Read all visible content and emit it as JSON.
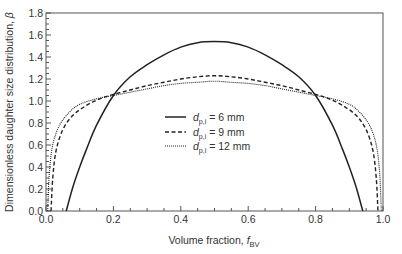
{
  "chart_data": {
    "type": "line",
    "title": "",
    "xlabel": "Volume fraction, f_BV",
    "xlabel_parts": {
      "main": "Volume fraction, ",
      "var": "f",
      "sub": "BV"
    },
    "ylabel": "Dimensionless daughter size distribution, β",
    "ylabel_parts": {
      "main": "Dimensionless daughter size distribution, ",
      "var": "β"
    },
    "xlim": [
      0.0,
      1.0
    ],
    "ylim": [
      0.0,
      1.8
    ],
    "xticks": [
      "0.0",
      "0.2",
      "0.4",
      "0.6",
      "0.8",
      "1.0"
    ],
    "yticks": [
      "0.0",
      "0.2",
      "0.4",
      "0.6",
      "0.8",
      "1.0",
      "1.2",
      "1.4",
      "1.6",
      "1.8"
    ],
    "grid": false,
    "legend_position": "center",
    "series": [
      {
        "name": "d_p,i = 6 mm",
        "legend": {
          "var": "d",
          "sub": "p,i",
          "text": " = 6 mm"
        },
        "style": "solid",
        "x": [
          0.06,
          0.08,
          0.1,
          0.12,
          0.15,
          0.2,
          0.25,
          0.3,
          0.35,
          0.4,
          0.45,
          0.5,
          0.55,
          0.6,
          0.65,
          0.7,
          0.75,
          0.8,
          0.85,
          0.88,
          0.9,
          0.92,
          0.94
        ],
        "y": [
          0.0,
          0.22,
          0.4,
          0.56,
          0.78,
          1.05,
          1.22,
          1.33,
          1.42,
          1.49,
          1.53,
          1.54,
          1.53,
          1.49,
          1.42,
          1.33,
          1.22,
          1.05,
          0.78,
          0.56,
          0.4,
          0.22,
          0.0
        ]
      },
      {
        "name": "d_p,i = 9 mm",
        "legend": {
          "var": "d",
          "sub": "p,i",
          "text": " = 9 mm"
        },
        "style": "dashed",
        "x": [
          0.015,
          0.02,
          0.03,
          0.05,
          0.08,
          0.12,
          0.16,
          0.2,
          0.25,
          0.3,
          0.35,
          0.4,
          0.45,
          0.5,
          0.55,
          0.6,
          0.65,
          0.7,
          0.75,
          0.8,
          0.84,
          0.88,
          0.92,
          0.95,
          0.97,
          0.98,
          0.985
        ],
        "y": [
          0.0,
          0.3,
          0.55,
          0.74,
          0.87,
          0.96,
          1.02,
          1.06,
          1.1,
          1.14,
          1.17,
          1.2,
          1.22,
          1.23,
          1.22,
          1.2,
          1.17,
          1.14,
          1.1,
          1.06,
          1.02,
          0.96,
          0.87,
          0.74,
          0.55,
          0.3,
          0.0
        ]
      },
      {
        "name": "d_p,i = 12 mm",
        "legend": {
          "var": "d",
          "sub": "p,i",
          "text": " = 12 mm"
        },
        "style": "dotted",
        "x": [
          0.005,
          0.01,
          0.02,
          0.04,
          0.07,
          0.1,
          0.15,
          0.2,
          0.25,
          0.3,
          0.35,
          0.4,
          0.45,
          0.5,
          0.55,
          0.6,
          0.65,
          0.7,
          0.75,
          0.8,
          0.85,
          0.9,
          0.93,
          0.96,
          0.98,
          0.99,
          0.995
        ],
        "y": [
          0.0,
          0.35,
          0.6,
          0.78,
          0.9,
          0.97,
          1.02,
          1.05,
          1.08,
          1.11,
          1.14,
          1.16,
          1.17,
          1.18,
          1.17,
          1.16,
          1.14,
          1.11,
          1.08,
          1.05,
          1.02,
          0.97,
          0.9,
          0.78,
          0.6,
          0.35,
          0.0
        ]
      }
    ]
  }
}
